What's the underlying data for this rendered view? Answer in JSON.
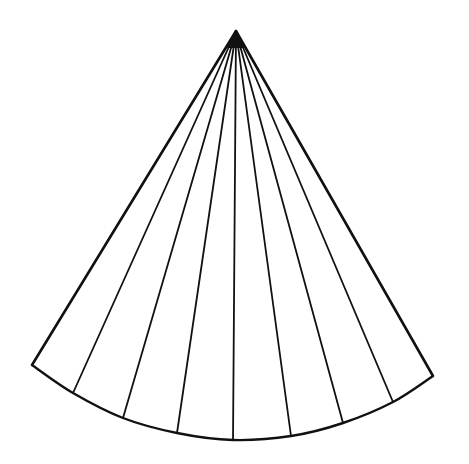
{
  "diagram": {
    "background": "#ffffff",
    "stroke_color": "#111111",
    "apex": [
      236,
      31
    ],
    "left_corner": [
      32,
      365
    ],
    "right_corner": [
      433,
      376
    ],
    "arc_points": [
      [
        32,
        365
      ],
      [
        73,
        393
      ],
      [
        123,
        418
      ],
      [
        177,
        433
      ],
      [
        233,
        440
      ],
      [
        291,
        436
      ],
      [
        343,
        423
      ],
      [
        393,
        402
      ],
      [
        433,
        376
      ]
    ],
    "segment_count": 8,
    "interior_line_count": 7
  }
}
